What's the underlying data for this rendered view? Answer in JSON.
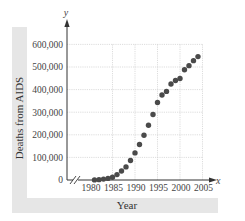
{
  "chart_data": {
    "type": "scatter",
    "title": "",
    "xlabel": "Year",
    "ylabel": "Deaths from AIDS",
    "x_axis_var": "x",
    "y_axis_var": "y",
    "xlim": [
      1980,
      2005
    ],
    "ylim": [
      0,
      600000
    ],
    "x_ticks": [
      1980,
      1985,
      1990,
      1995,
      2000,
      2005
    ],
    "x_tick_labels": [
      "1980",
      "1985",
      "1990",
      "1995",
      "2000",
      "2005"
    ],
    "y_ticks": [
      0,
      100000,
      200000,
      300000,
      400000,
      500000,
      600000
    ],
    "y_tick_labels": [
      "0",
      "100,000",
      "200,000",
      "300,000",
      "400,000",
      "500,000",
      "600,000"
    ],
    "grid": true,
    "axis_break_x": true,
    "legend": null,
    "series": [
      {
        "name": "Deaths from AIDS",
        "x": [
          1981,
          1982,
          1983,
          1984,
          1985,
          1986,
          1987,
          1988,
          1989,
          1990,
          1991,
          1992,
          1993,
          1994,
          1995,
          1996,
          1997,
          1998,
          1999,
          2000,
          2001,
          2002,
          2003,
          2004
        ],
        "y": [
          500,
          1500,
          4000,
          7000,
          12000,
          24000,
          40000,
          58000,
          86000,
          120000,
          157000,
          198000,
          242000,
          290000,
          343000,
          376000,
          392000,
          425000,
          440000,
          449000,
          488000,
          506000,
          528000,
          546000
        ]
      }
    ],
    "colors": {
      "points": "#4a4a4a",
      "grid": "#cfcfcf",
      "axis": "#333333",
      "label_band": "#e6e6e6"
    }
  }
}
